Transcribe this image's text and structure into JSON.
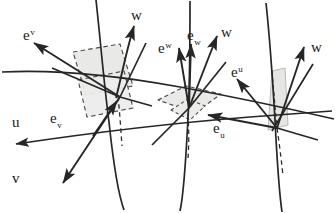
{
  "figure": {
    "background_color": "#ffffff",
    "stroke_color": "#262626",
    "patch_fill_color": "#e8e8e6",
    "patch_dash_color": "#4a4a4a"
  },
  "axis_labels": {
    "u": "u",
    "v": "v"
  },
  "vector_labels": [
    {
      "id": "e-sup-v",
      "base": "e",
      "script": "v",
      "script_kind": "sup",
      "x": 23,
      "y": 27
    },
    {
      "id": "w-left",
      "base": "w",
      "script": "",
      "script_kind": "none",
      "x": 131,
      "y": 7
    },
    {
      "id": "e-sub-v",
      "base": "e",
      "script": "v",
      "script_kind": "sub",
      "x": 50,
      "y": 110
    },
    {
      "id": "e-sup-w",
      "base": "e",
      "script": "w",
      "script_kind": "sup",
      "x": 158,
      "y": 40
    },
    {
      "id": "e-sub-w",
      "base": "e",
      "script": "w",
      "script_kind": "sub",
      "x": 187,
      "y": 27
    },
    {
      "id": "w-mid",
      "base": "w",
      "script": "",
      "script_kind": "none",
      "x": 221,
      "y": 24
    },
    {
      "id": "e-sup-u",
      "base": "e",
      "script": "u",
      "script_kind": "sup",
      "x": 231,
      "y": 64
    },
    {
      "id": "e-sub-u",
      "base": "e",
      "script": "u",
      "script_kind": "sub",
      "x": 213,
      "y": 120
    },
    {
      "id": "w-right",
      "base": "w",
      "script": "",
      "script_kind": "none",
      "x": 311,
      "y": 39
    },
    {
      "id": "u-axis",
      "base": "u",
      "script": "",
      "script_kind": "none",
      "x": 12,
      "y": 114
    },
    {
      "id": "v-axis",
      "base": "v",
      "script": "",
      "script_kind": "none",
      "x": 12,
      "y": 170
    }
  ],
  "grid_curves": {
    "u_curves": [
      "M 4 144 C 70 136 160 124 250 117 C 290 114 318 112 332 111",
      "M 2 72 C 60 69 120 76 180 87 C 240 98 295 110 334 119"
    ],
    "v_curves": [
      "M 96 0 C 100 36 104 84 109 122 C 113 160 119 196 124 210",
      "M 190 0 C 190 36 190 84 188 122 C 186 160 183 198 180 211",
      "M 268 3 C 272 40 274 86 276 124 C 278 162 280 198 282 212"
    ]
  },
  "patches": [
    {
      "id": "patch-left",
      "desc": "two overlapping dashed parallelograms, light gray fill"
    },
    {
      "id": "patch-mid",
      "desc": "flat dashed diamond, light gray fill"
    },
    {
      "id": "patch-right",
      "desc": "narrow vertical sliver parallelogram, light gray fill"
    }
  ]
}
